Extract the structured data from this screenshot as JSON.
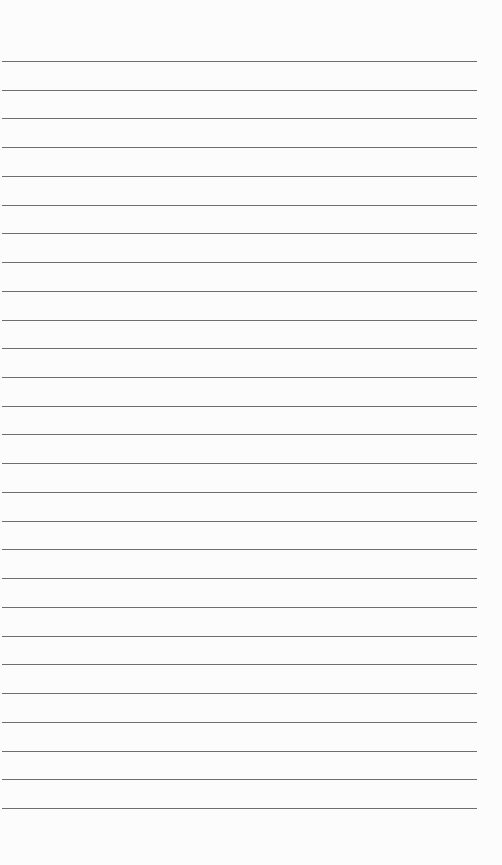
{
  "page": {
    "type": "lined-paper",
    "background_color": "#fcfcfc",
    "line_color": "#6e6e6e",
    "line_count": 27,
    "first_line_y": 61,
    "line_spacing": 28.73,
    "line_left": 2,
    "line_width": 475,
    "text": ""
  }
}
